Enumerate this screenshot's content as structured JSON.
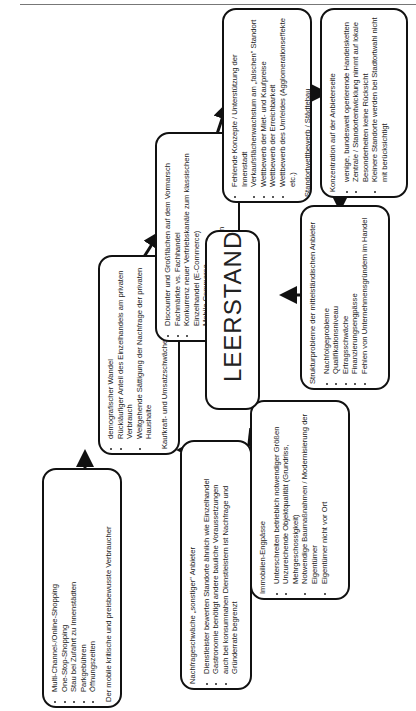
{
  "center": {
    "label": "LEERSTAND"
  },
  "boxes": [
    {
      "id": "verbraucher",
      "items": [
        "Multi-Channel-/Online-Shopping",
        "One-Stop-Shopping",
        "Stau bei Zufahrt zu Innenstädten",
        "Parkgebühren",
        "Öffnungszeiten"
      ],
      "title": "Der mobile kritische und preisbewusste Verbraucher"
    },
    {
      "id": "kaufkraft",
      "items": [
        "demografischer Wandel",
        "Rückläufiger Anteil des Einzelhandels am privaten Verbrauch",
        "Weitgehende Sättigung der Nachfrage der privaten Haushalte"
      ],
      "title": "Kaufkraft- und Umsatzschwäche des Einzelhandels"
    },
    {
      "id": "vertriebsformen",
      "items": [
        "Discounter und Großflächen auf dem Vormarsch",
        "Fachmärkte vs. Fachhandel",
        "Konkurrenz neuer Vertriebskanäle zum klassischen Einzelhandel (E-Commerce)",
        "Mobile Commerce"
      ],
      "title": "Wettbewerb der Vertriebsformen"
    },
    {
      "id": "standort",
      "items": [
        "Fehlende Konzepte / Unterstützung der Innenstadt",
        "Verkaufsflächenwachstum am „falschen\" Standort",
        "Wettbewerb der Miet- und Kaufpreise",
        "Wettbewerb der Erreichbarkeit",
        "Wettbewerb des Umfeldes (Agglomerationseffekte etc.)"
      ],
      "title": "Standortwettbewerb / Städtebau"
    },
    {
      "id": "konzentration",
      "title": "Konzentration auf der Anbieterseite",
      "items": [
        "wenige, bundesweit operierende Handelsketten",
        "Zentrale / Standortentwicklung nimmt auf lokale Besonderheiten keine Rücksicht",
        "Kleinere Standorte werden bei Stadtortwahl nicht mit berücksichtigt"
      ]
    },
    {
      "id": "struktur",
      "title": "Strukturprobleme der mittelständischen Anbieter",
      "items": [
        "Nachfolgeprobleme",
        "Qualifikationsniveau",
        "Ertragsschwäche",
        "Finanzierungsengpässe",
        "Fehlen von Unternehmensgründern im Handel"
      ]
    },
    {
      "id": "immobilien",
      "title": "Immobilien-Engpässe",
      "items": [
        "Unterschreiten betrieblich notwendiger Größen",
        "Unzureichende Objektqualität (Grundriss, Mehrgeschossigkeit)",
        "Notwendige Baumaßnahmen / Modernisierung der Eigentümer",
        "Eigentümer nicht vor Ort"
      ]
    },
    {
      "id": "sonstige",
      "title": "Nachfrageschwäche „sonstiger\" Anbieter",
      "items": [
        "Dienstleister bewerten Standorte ähnlich wie Einzelhandel",
        "Gastronomie benötigt andere bauliche Voraussetzungen",
        "auch bei konsumnahen Dienstleistern ist Nachfrage und Gründerrate begrenzt"
      ]
    }
  ]
}
